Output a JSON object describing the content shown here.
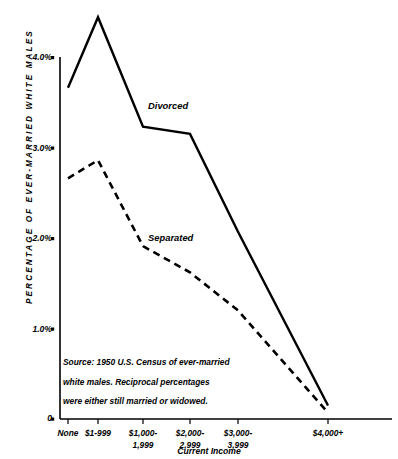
{
  "chart_data": {
    "type": "line",
    "title": "",
    "xlabel": "Current Income",
    "ylabel": "PERCENTAGE OF EVER-MARRIED WHITE MALES",
    "categories": [
      "None",
      "$1-999",
      "$1,000-\n1,999",
      "$2,000-\n2,999",
      "$3,000-\n3,999",
      "$4,000+"
    ],
    "x_pixels": [
      68,
      98,
      143,
      190,
      238,
      328
    ],
    "ylim": [
      0,
      4.4
    ],
    "ytick_labels": [
      "0",
      "1.0%",
      "2.0%",
      "3.0%",
      "4.0%"
    ],
    "ytick_values": [
      0,
      1.0,
      2.0,
      3.0,
      4.0
    ],
    "grid": false,
    "legend_position": "inline-annotations",
    "series": [
      {
        "name": "Divorced",
        "style": "solid",
        "color": "#000000",
        "values": [
          3.66,
          4.44,
          3.23,
          3.15,
          2.07,
          0.15
        ]
      },
      {
        "name": "Separated",
        "style": "dashed",
        "color": "#000000",
        "values": [
          2.66,
          2.86,
          1.91,
          1.62,
          1.2,
          0.07
        ]
      }
    ],
    "annotations": [
      {
        "text": "Divorced",
        "series": "Divorced"
      },
      {
        "text": "Separated",
        "series": "Separated"
      }
    ],
    "source_note_lines": [
      "Source: 1950 U.S. Census of ever-married",
      "white males. Reciprocal percentages",
      "were either still married or widowed."
    ]
  }
}
